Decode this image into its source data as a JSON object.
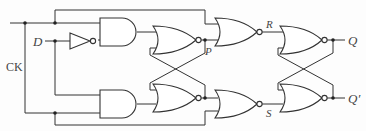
{
  "diagram": {
    "title": "",
    "type": "logic-circuit",
    "labels": {
      "clock": "CK",
      "data": "D",
      "p": "P",
      "r": "R",
      "s": "S",
      "q": "Q",
      "q_bar": "Q′"
    },
    "gates": [
      {
        "id": "inverter",
        "type": "NOT",
        "input": "D"
      },
      {
        "id": "and-top",
        "type": "AND",
        "inputs": [
          "CK",
          "D′"
        ]
      },
      {
        "id": "and-bottom",
        "type": "AND",
        "inputs": [
          "D",
          "CK"
        ]
      },
      {
        "id": "nor-top-1",
        "type": "NOR",
        "output": "P"
      },
      {
        "id": "nor-bottom-1",
        "type": "NOR"
      },
      {
        "id": "nor-top-2",
        "type": "NOR",
        "output": "R"
      },
      {
        "id": "nor-bottom-2",
        "type": "NOR",
        "output": "S"
      },
      {
        "id": "nor-top-3",
        "type": "NOR",
        "output": "Q"
      },
      {
        "id": "nor-bottom-3",
        "type": "NOR",
        "output": "Q′"
      }
    ],
    "colors": {
      "line": "#333333",
      "label": "#444444",
      "background": "#fdfdfd"
    }
  }
}
